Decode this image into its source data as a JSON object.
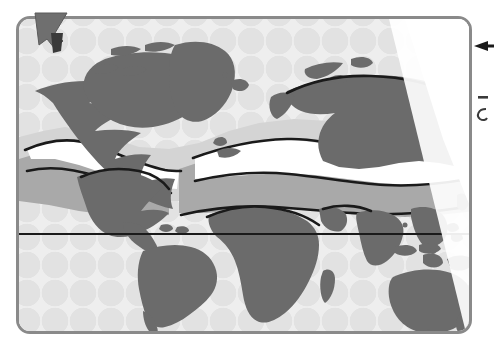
{
  "figure": {
    "kind": "world-map"
  },
  "map": {
    "frame": {
      "border_color": "#8a8a8a",
      "corner_radius_px": 14,
      "x": 16,
      "y": 16,
      "width": 456,
      "height": 318
    },
    "legend_colors": {
      "land_dark": "#6a6a6a",
      "zone_mid_gray": "#a8a8a8",
      "zone_light_gray": "#cfcfcf",
      "zone_white": "#ffffff",
      "ocean_base": "#eeeeee",
      "ocean_scallop": "#e2e2e2",
      "outline": "#1a1a1a"
    },
    "reference_line": {
      "name": "equator",
      "y_px": 215,
      "color": "#1a1a1a",
      "thickness_px": 2
    },
    "scallop_pattern": {
      "shape": "fish-scale-arcs",
      "cell_width_px": 28,
      "cell_height_px": 28
    },
    "glare": {
      "shape": "diagonal-wedge",
      "corner": "top-right",
      "color": "#ffffff"
    },
    "landmasses": [
      "North America",
      "Greenland",
      "South America",
      "Europe",
      "Africa",
      "Asia",
      "Russia",
      "India",
      "Indonesia",
      "Australia",
      "New Zealand",
      "Japan",
      "Madagascar",
      "British Isles",
      "Arabian Peninsula",
      "Iceland"
    ],
    "zones": [
      {
        "name": "northern-light-band",
        "fill": "#cfcfcf"
      },
      {
        "name": "temperate-white-band",
        "fill": "#ffffff"
      },
      {
        "name": "subtropical-mid-band",
        "fill": "#a8a8a8"
      },
      {
        "name": "equatorial-land",
        "fill": "#6a6a6a"
      }
    ]
  },
  "cursor": {
    "name": "pointer-cursor",
    "x": 33,
    "y": 11,
    "fill_outer": "#6f6f6f",
    "fill_tip": "#3a3a3a"
  },
  "annotation": {
    "arrow": {
      "name": "left-arrow",
      "direction": "left",
      "x": 478,
      "y": 46,
      "color": "#1a1a1a"
    },
    "marks": [
      {
        "name": "dash-mark",
        "glyph": "–",
        "x": 478,
        "y": 97
      },
      {
        "name": "curve-mark",
        "glyph": "Ɐ",
        "x": 478,
        "y": 114
      }
    ]
  }
}
